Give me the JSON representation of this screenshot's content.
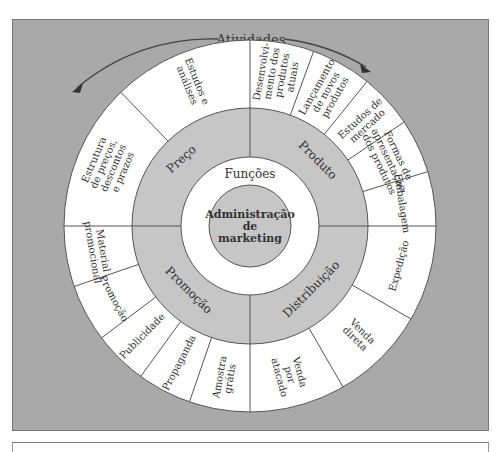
{
  "diagram": {
    "top_label": "Atividades",
    "center": [
      "Administração",
      "de",
      "marketing"
    ],
    "inner_ring_label": "Funções",
    "colors": {
      "background": "#a9a9a9",
      "ring_gray": "#c6c6c6",
      "ring_white": "#ffffff",
      "line": "#555555",
      "text": "#333333"
    },
    "functions": [
      {
        "name": "Preço",
        "quadrant": "top-left",
        "activities": [
          [
            "Estudos e",
            "análises"
          ],
          [
            "Estrutura",
            "de preços,",
            "descontos",
            "e prazos"
          ]
        ]
      },
      {
        "name": "Produto",
        "quadrant": "top-right",
        "activities": [
          [
            "Desenvolvi-",
            "mento dos",
            "produtos",
            "atuais"
          ],
          [
            "Lançamento",
            "de novos",
            "produtos"
          ],
          [
            "Estudos de",
            "mercado"
          ],
          [
            "Formas de",
            "apresentação",
            "dos produtos"
          ],
          [
            "Embalagem"
          ]
        ]
      },
      {
        "name": "Distribuição",
        "quadrant": "bottom-right",
        "activities": [
          [
            "Expedição"
          ],
          [
            "Venda",
            "direta"
          ],
          [
            "Venda",
            "por",
            "atacado"
          ]
        ]
      },
      {
        "name": "Promoção",
        "quadrant": "bottom-left",
        "activities": [
          [
            "Amostra",
            "grátis"
          ],
          [
            "Propaganda"
          ],
          [
            "Publicidade"
          ],
          [
            "Promoção"
          ],
          [
            "Material",
            "promocional"
          ]
        ]
      }
    ]
  }
}
